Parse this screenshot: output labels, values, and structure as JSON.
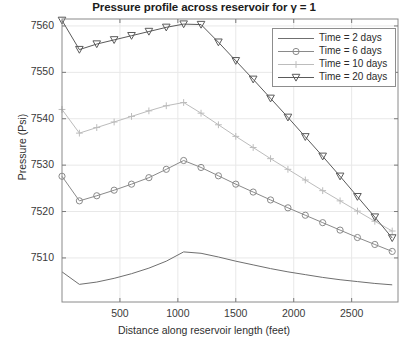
{
  "chart_data": {
    "type": "line",
    "title": "Pressure profile across reservoir for γ = 1",
    "xlabel": "Distance along reservoir length (feet)",
    "ylabel": "Pressure (Psi)",
    "xlim": [
      0,
      2900
    ],
    "ylim": [
      7500.5,
      7561.5
    ],
    "xticks": [
      500,
      1000,
      1500,
      2000,
      2500
    ],
    "yticks": [
      7510,
      7520,
      7530,
      7540,
      7550,
      7560
    ],
    "grid": true,
    "legend_position": "upper right",
    "x": [
      0,
      150,
      300,
      450,
      600,
      750,
      900,
      1050,
      1200,
      1350,
      1500,
      1650,
      1800,
      1950,
      2100,
      2250,
      2400,
      2550,
      2700,
      2850
    ],
    "series": [
      {
        "name": "Time = 2 days",
        "marker": "none",
        "color": "#6f6f6f",
        "values": [
          7507.0,
          7504.3,
          7504.8,
          7505.6,
          7506.6,
          7507.8,
          7509.3,
          7511.3,
          7511.0,
          7510.2,
          7509.3,
          7508.5,
          7507.7,
          7507.0,
          7506.4,
          7505.8,
          7505.3,
          7504.9,
          7504.5,
          7504.2
        ]
      },
      {
        "name": "Time = 6 days",
        "marker": "circle",
        "color": "#8a8a8a",
        "values": [
          7527.6,
          7522.3,
          7523.4,
          7524.6,
          7525.9,
          7527.3,
          7529.1,
          7531.0,
          7529.5,
          7527.7,
          7525.9,
          7524.2,
          7522.5,
          7520.8,
          7519.2,
          7517.6,
          7516.0,
          7514.4,
          7512.9,
          7511.4
        ]
      },
      {
        "name": "Time = 10 days",
        "marker": "plus",
        "color": "#bcbcbc",
        "values": [
          7542.0,
          7536.9,
          7538.1,
          7539.3,
          7540.5,
          7541.7,
          7542.8,
          7543.5,
          7541.2,
          7538.7,
          7536.2,
          7533.8,
          7531.4,
          7529.1,
          7526.8,
          7524.5,
          7522.3,
          7520.1,
          7517.9,
          7515.8
        ]
      },
      {
        "name": "Time = 20 days",
        "marker": "triangle-down",
        "color": "#5a5a5a",
        "values": [
          7561.2,
          7554.9,
          7556.1,
          7557.0,
          7557.9,
          7558.8,
          7559.7,
          7560.4,
          7560.3,
          7556.5,
          7552.5,
          7548.5,
          7544.4,
          7540.3,
          7536.1,
          7531.9,
          7527.6,
          7523.2,
          7518.8,
          7514.3
        ]
      }
    ]
  },
  "axes": {
    "ytick_labels": [
      "7560",
      "7550",
      "7540",
      "7530",
      "7520",
      "7510"
    ],
    "xtick_labels": [
      "500",
      "1000",
      "1500",
      "2000",
      "2500"
    ]
  },
  "legend": {
    "entries": [
      {
        "label": "Time = 2 days"
      },
      {
        "label": "Time = 6 days"
      },
      {
        "label": "Time = 10 days"
      },
      {
        "label": "Time = 20 days"
      }
    ]
  }
}
